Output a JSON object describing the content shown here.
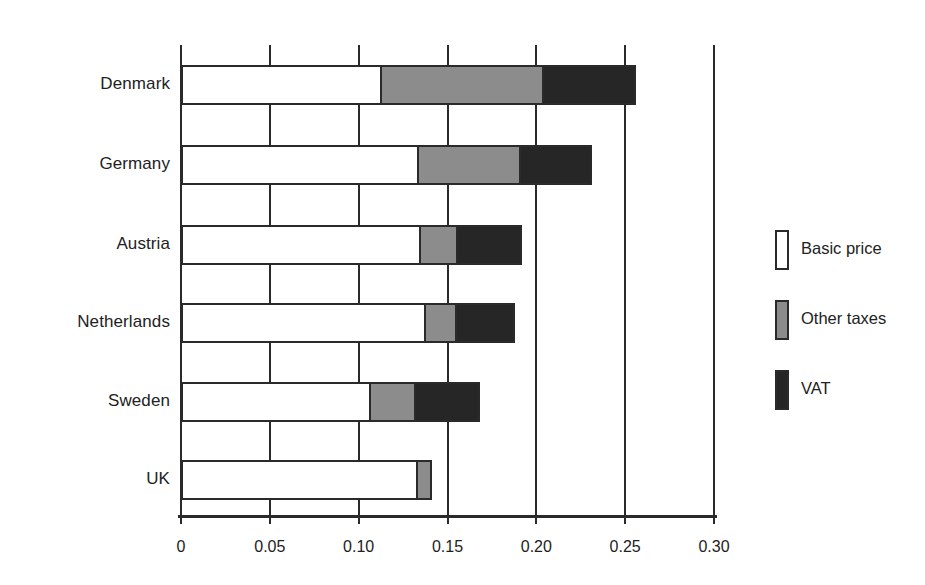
{
  "chart_data": {
    "type": "bar",
    "orientation": "horizontal",
    "stacked": true,
    "title": "",
    "xlabel": "",
    "ylabel": "",
    "xlim": [
      0,
      0.3
    ],
    "grid": true,
    "legend_position": "right",
    "categories": [
      "Denmark",
      "Germany",
      "Austria",
      "Netherlands",
      "Sweden",
      "UK"
    ],
    "xticks": [
      "0",
      "0.05",
      "0.10",
      "0.15",
      "0.20",
      "0.25",
      "0.30"
    ],
    "xtick_values": [
      0,
      0.05,
      0.1,
      0.15,
      0.2,
      0.25,
      0.3
    ],
    "series": [
      {
        "name": "Basic price",
        "color": "#ffffff",
        "values": [
          0.112,
          0.133,
          0.134,
          0.137,
          0.106,
          0.132
        ]
      },
      {
        "name": "Other taxes",
        "color": "#8c8c8c",
        "values": [
          0.091,
          0.057,
          0.021,
          0.017,
          0.025,
          0.008
        ]
      },
      {
        "name": "VAT",
        "color": "#262626",
        "values": [
          0.052,
          0.04,
          0.036,
          0.033,
          0.036,
          0.0
        ]
      }
    ],
    "totals": [
      0.255,
      0.23,
      0.191,
      0.187,
      0.167,
      0.14
    ]
  },
  "legend": {
    "items": [
      {
        "label": "Basic price",
        "color": "#ffffff"
      },
      {
        "label": "Other taxes",
        "color": "#8c8c8c"
      },
      {
        "label": "VAT",
        "color": "#262626"
      }
    ]
  },
  "axis": {
    "x_tick_labels": [
      "0",
      "0.05",
      "0.10",
      "0.15",
      "0.20",
      "0.25",
      "0.30"
    ]
  },
  "colors": {
    "axis": "#2a2a2a",
    "basic_price": "#ffffff",
    "other_taxes": "#8c8c8c",
    "vat": "#262626"
  }
}
